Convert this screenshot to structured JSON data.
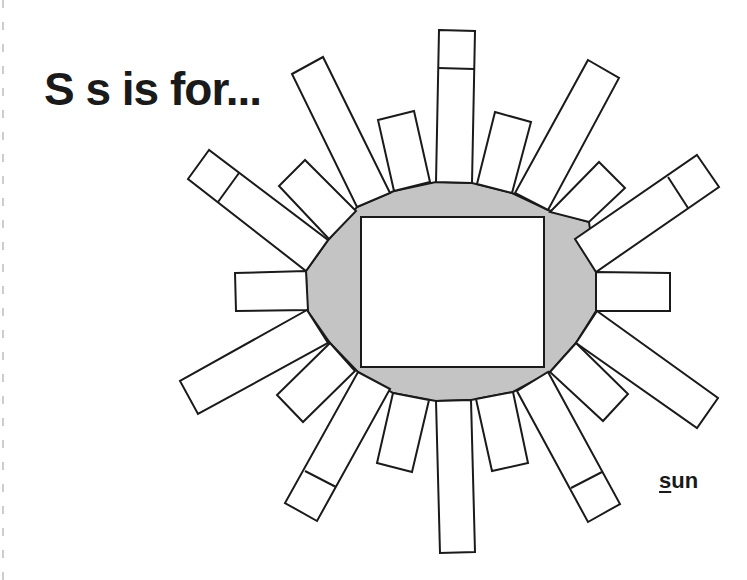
{
  "worksheet": {
    "title": "S s is for...",
    "word": {
      "first_letter": "s",
      "rest": "un",
      "full": "sun"
    },
    "colors": {
      "ink": "#1a1a1a",
      "sun_fill": "#c4c4c4",
      "box_fill": "#ffffff",
      "background": "#ffffff"
    },
    "drawing_area": {
      "label": "",
      "shape": "rectangle"
    },
    "sun_rays_count": 20
  }
}
